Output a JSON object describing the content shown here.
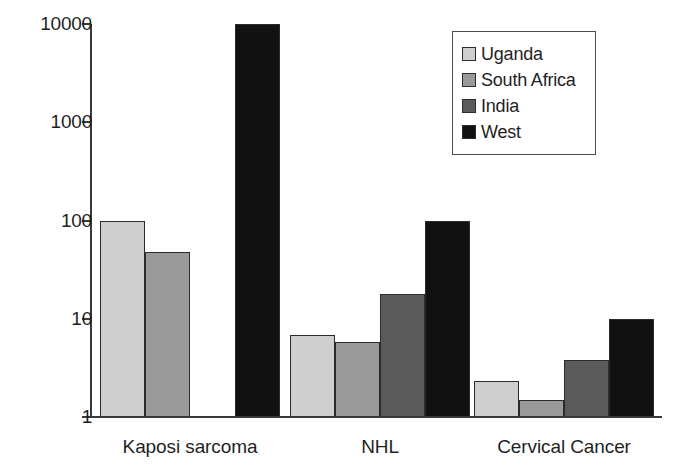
{
  "chart_data": {
    "type": "bar",
    "title": "",
    "subtitle": "",
    "xlabel": "",
    "ylabel": "",
    "yscale": "log",
    "ylim": [
      1,
      10000
    ],
    "grid": false,
    "legend_position": "top-right",
    "y_ticks": [
      {
        "label": "10000",
        "value": 10000
      },
      {
        "label": "1000",
        "value": 1000
      },
      {
        "label": "100",
        "value": 100
      },
      {
        "label": "10",
        "value": 10
      },
      {
        "label": "1",
        "value": 1
      }
    ],
    "categories": [
      "Kaposi sarcoma",
      "NHL",
      "Cervical Cancer"
    ],
    "series": [
      {
        "name": "Uganda",
        "color": "#cfcfcf",
        "values": [
          100,
          6.8,
          2.3
        ]
      },
      {
        "name": "South Africa",
        "color": "#9a9a9a",
        "values": [
          48,
          5.8,
          1.5
        ]
      },
      {
        "name": "India",
        "color": "#5a5a5a",
        "values": [
          1,
          18,
          3.8
        ]
      },
      {
        "name": "West",
        "color": "#111111",
        "values": [
          10000,
          100,
          10
        ]
      }
    ]
  },
  "legend": {
    "items": [
      {
        "label": "Uganda",
        "color": "#cfcfcf"
      },
      {
        "label": "South Africa",
        "color": "#9a9a9a"
      },
      {
        "label": "India",
        "color": "#5a5a5a"
      },
      {
        "label": "West",
        "color": "#111111"
      }
    ]
  }
}
